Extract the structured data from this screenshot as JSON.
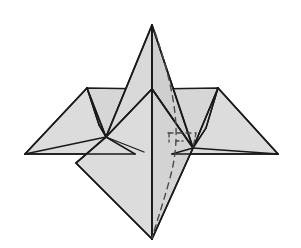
{
  "figure": {
    "title": "Folded paper model",
    "kind": "origami-polyhedron-diagram",
    "canvas": {
      "width": 301,
      "height": 248,
      "background": "#ffffff"
    },
    "style": {
      "face_fill": "#d9d9d9",
      "face_fill_light": "#e0e0e0",
      "face_fill_mid": "#d4d4d4",
      "edge_color": "#1a1a1a",
      "hidden_edge_color": "#4a4a4a",
      "edge_width": 1.7,
      "thin_edge_width": 1.2,
      "hidden_edge_width": 1.3,
      "hidden_dash": "5 4",
      "hidden_dash_short": "4 3"
    },
    "vertices": {
      "apex": {
        "x": 152,
        "y": 25,
        "label": "top-spike-apex"
      },
      "neck": {
        "x": 152,
        "y": 89,
        "label": "center-neck"
      },
      "bottom": {
        "x": 152,
        "y": 239,
        "label": "bottom-point"
      },
      "left_peak": {
        "x": 87,
        "y": 88,
        "label": "left-wing-peak"
      },
      "right_peak": {
        "x": 218,
        "y": 88,
        "label": "right-wing-peak"
      },
      "left_tip": {
        "x": 25,
        "y": 154,
        "label": "left-wing-tip"
      },
      "right_tip": {
        "x": 278,
        "y": 154,
        "label": "right-wing-tip"
      },
      "left_hub": {
        "x": 106,
        "y": 137,
        "label": "left-junction-hub"
      },
      "right_hub": {
        "x": 193,
        "y": 148,
        "label": "right-junction-hub"
      },
      "diamond_left": {
        "x": 76,
        "y": 163,
        "label": "diamond-left-corner"
      },
      "left_wing_base": {
        "x": 114,
        "y": 154,
        "label": "left-wing-base"
      },
      "right_wing_base": {
        "x": 190,
        "y": 154,
        "label": "right-wing-base"
      },
      "inner_left": {
        "x": 99,
        "y": 125,
        "label": "left-inner-fold"
      },
      "inner_right": {
        "x": 206,
        "y": 128,
        "label": "right-inner-fold"
      },
      "crease_mid": {
        "x": 144,
        "y": 152,
        "label": "left-crease-endpoint"
      },
      "hidden_corner": {
        "x": 196,
        "y": 133,
        "label": "hidden-rear-corner"
      }
    },
    "faces": [
      {
        "name": "spike-left-face",
        "shade": "#d9d9d9"
      },
      {
        "name": "spike-right-face",
        "shade": "#d4d4d4"
      },
      {
        "name": "left-wing-face",
        "shade": "#dcdcdc"
      },
      {
        "name": "right-wing-face",
        "shade": "#dcdcdc"
      },
      {
        "name": "left-wing-underfold",
        "shade": "#d2d2d2"
      },
      {
        "name": "right-wing-underfold",
        "shade": "#d2d2d2"
      },
      {
        "name": "body-left-face",
        "shade": "#d9d9d9"
      },
      {
        "name": "body-right-face",
        "shade": "#d4d4d4"
      },
      {
        "name": "lower-diamond-left",
        "shade": "#dcdcdc"
      },
      {
        "name": "lower-diamond-right",
        "shade": "#d6d6d6"
      }
    ],
    "hidden_edges": [
      {
        "name": "apex-to-bottom-dashed"
      },
      {
        "name": "rear-corner-horizontal-dashed"
      },
      {
        "name": "rear-corner-vertical-dashed"
      },
      {
        "name": "rear-short-tick-dashed"
      }
    ]
  }
}
